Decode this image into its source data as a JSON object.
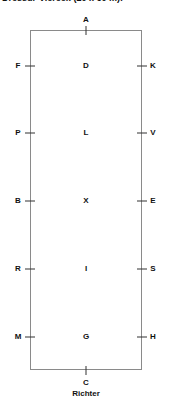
{
  "title": "Dressur-Viereck (20 x 60 m):",
  "arena": {
    "width_m": 20,
    "length_m": 60,
    "border_color": "#8a8a8a"
  },
  "top_letter": "A",
  "bottom_letter": "C",
  "judge_label": "Richter",
  "rows": [
    {
      "left": "F",
      "center": "D",
      "right": "K"
    },
    {
      "left": "P",
      "center": "L",
      "right": "V"
    },
    {
      "left": "B",
      "center": "X",
      "right": "E"
    },
    {
      "left": "R",
      "center": "I",
      "right": "S"
    },
    {
      "left": "M",
      "center": "G",
      "right": "H"
    }
  ]
}
